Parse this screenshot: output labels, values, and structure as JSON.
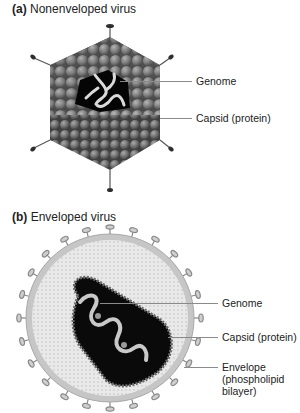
{
  "panel_a": {
    "letter": "(a)",
    "title": "Nonenveloped virus",
    "labels": {
      "genome": "Genome",
      "capsid": "Capsid (protein)"
    }
  },
  "panel_b": {
    "letter": "(b)",
    "title": "Enveloped virus",
    "labels": {
      "genome": "Genome",
      "capsid": "Capsid (protein)",
      "envelope_line1": "Envelope",
      "envelope_line2": "(phospholipid",
      "envelope_line3": "bilayer)"
    }
  },
  "colors": {
    "capsid_sphere": "#6e6e6e",
    "genome_strand": "#d8d8d8",
    "core": "#0a0a0a",
    "envelope_fill": "#e6e6e6",
    "membrane": "#bdbdbd",
    "leader_line": "#8a8a8a"
  }
}
